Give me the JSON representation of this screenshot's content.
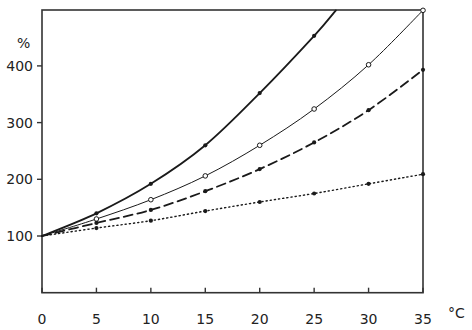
{
  "chart_data": {
    "type": "line",
    "title": "",
    "xlabel": "°C",
    "ylabel": "%",
    "xlim": [
      0,
      35
    ],
    "ylim": [
      0,
      498
    ],
    "grid": false,
    "legend": null,
    "x_ticks": [
      0,
      5,
      10,
      15,
      20,
      25,
      30,
      35
    ],
    "y_ticks": [
      100,
      200,
      300,
      400
    ],
    "x": [
      0,
      5,
      10,
      15,
      20,
      25,
      30,
      35
    ],
    "series": [
      {
        "name": "thick solid, filled markers",
        "style": "solid-thick",
        "marker": "filled",
        "values": [
          100,
          140,
          192,
          260,
          352,
          453,
          null,
          null
        ],
        "extends_to": {
          "x": 27,
          "y": 498
        }
      },
      {
        "name": "thin solid, open markers",
        "style": "solid-thin",
        "marker": "open",
        "values": [
          100,
          130,
          164,
          206,
          260,
          324,
          402,
          498
        ]
      },
      {
        "name": "dashed, filled markers",
        "style": "dashed",
        "marker": "filled",
        "values": [
          100,
          123,
          146,
          179,
          218,
          265,
          322,
          393
        ]
      },
      {
        "name": "dotted, filled markers",
        "style": "dotted",
        "marker": "filled",
        "values": [
          100,
          114,
          127,
          144,
          160,
          175,
          192,
          209
        ]
      }
    ]
  },
  "axes": {
    "y_unit": "%",
    "x_unit": "°C",
    "x_tick_labels": [
      "0",
      "5",
      "10",
      "15",
      "20",
      "25",
      "30",
      "35"
    ],
    "y_tick_labels": [
      "100",
      "200",
      "300",
      "400"
    ]
  },
  "colors": {
    "line": "#1a1a1a",
    "frame": "#333333",
    "background": "#ffffff"
  }
}
